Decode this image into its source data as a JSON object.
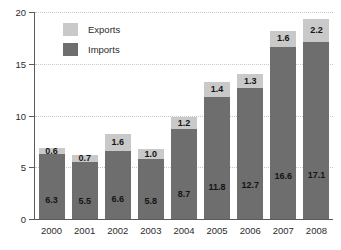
{
  "chart_data": {
    "type": "bar",
    "subtype": "stacked-bar",
    "title": "",
    "xlabel": "",
    "ylabel": "",
    "ylim": [
      0,
      20
    ],
    "yticks": [
      0,
      5,
      10,
      15,
      20
    ],
    "grid": true,
    "legend_position": "top-left-inside",
    "categories": [
      "2000",
      "2001",
      "2002",
      "2003",
      "2004",
      "2005",
      "2006",
      "2007",
      "2008"
    ],
    "series": [
      {
        "name": "Imports",
        "color": "#6e6e6e",
        "values": [
          6.3,
          5.5,
          6.6,
          5.8,
          8.7,
          11.8,
          12.7,
          16.6,
          17.1
        ],
        "labels": [
          "6.3",
          "5.5",
          "6.6",
          "5.8",
          "8.7",
          "11.8",
          "12.7",
          "16.6",
          "17.1"
        ]
      },
      {
        "name": "Exports",
        "color": "#c9c9c9",
        "values": [
          0.6,
          0.7,
          1.6,
          1.0,
          1.2,
          1.4,
          1.3,
          1.6,
          2.2
        ],
        "labels": [
          "0.6",
          "0.7",
          "1.6",
          "1.0",
          "1.2",
          "1.4",
          "1.3",
          "1.6",
          "2.2"
        ]
      }
    ],
    "totals": [
      6.9,
      6.2,
      8.2,
      6.8,
      9.9,
      13.2,
      14.0,
      18.2,
      19.3
    ]
  },
  "legend": {
    "entries": [
      {
        "label": "Exports",
        "color": "#c9c9c9"
      },
      {
        "label": "Imports",
        "color": "#6e6e6e"
      }
    ]
  },
  "axis": {
    "y_tick_labels": [
      "20",
      "15",
      "10",
      "5",
      "0"
    ]
  }
}
